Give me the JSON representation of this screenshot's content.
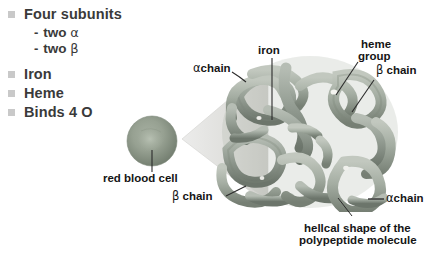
{
  "figure": {
    "title_alt": "Hemoglobin structure diagram",
    "background": "#ffffff"
  },
  "bullets": {
    "items": [
      {
        "marker": "square",
        "label": "Four subunits",
        "level": 1
      },
      {
        "marker": "dash",
        "label_pre": "two",
        "greek": "α",
        "level": 2
      },
      {
        "marker": "dash",
        "label_pre": "two",
        "greek": "β",
        "level": 2
      },
      {
        "marker": "square",
        "label": "Iron",
        "level": 1
      },
      {
        "marker": "square",
        "label": "Heme",
        "level": 1
      },
      {
        "marker": "square",
        "label": "Binds 4 O",
        "level": 1
      }
    ],
    "dash_char": "-"
  },
  "labels": {
    "alpha_chain_left": "αchain",
    "iron": "iron",
    "heme_group_line1": "heme",
    "heme_group_line2": "group",
    "beta_chain_right": "β chain",
    "red_blood_cell": "red blood cell",
    "beta_chain_bottom": "β chain",
    "alpha_chain_right": "αchain",
    "caption_line1": "hellcal shape of the",
    "caption_line2": "polypeptide molecule"
  },
  "colors": {
    "bullet_square": "#c9c9c9",
    "bullet_text": "#3a3a3a",
    "label_text": "#151515",
    "cell_fill": "#8e9a8a",
    "cell_center": "#b3bcae",
    "cone_fill": "#dcdcd8",
    "molecule_tube": "#9aa39a",
    "molecule_tube_dark": "#6e776e",
    "leader_line": "#2b2b2b"
  }
}
